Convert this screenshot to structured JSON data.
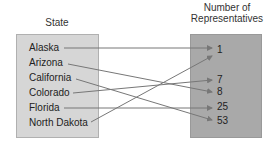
{
  "domain": {
    "title": "State",
    "items": [
      "Alaska",
      "Arizona",
      "California",
      "Colorado",
      "Florida",
      "North Dakota"
    ]
  },
  "range": {
    "title_line1": "Number of",
    "title_line2": "Representatives",
    "items": [
      "1",
      "7",
      "8",
      "25",
      "53"
    ]
  },
  "mapping": [
    {
      "from": "Alaska",
      "to": "1"
    },
    {
      "from": "Arizona",
      "to": "8"
    },
    {
      "from": "California",
      "to": "53"
    },
    {
      "from": "Colorado",
      "to": "7"
    },
    {
      "from": "Florida",
      "to": "25"
    },
    {
      "from": "North Dakota",
      "to": "1"
    }
  ],
  "colors": {
    "left_box": "#d6d6d6",
    "right_box": "#a9a9a9",
    "arrow": "#777777"
  }
}
